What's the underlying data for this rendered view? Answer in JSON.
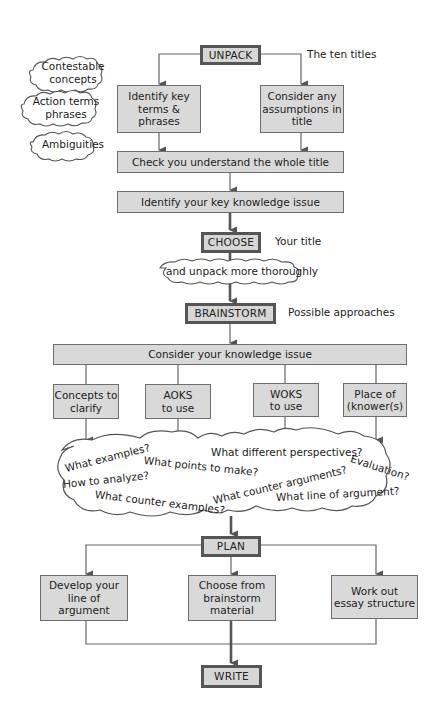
{
  "diagram": {
    "type": "flowchart",
    "colors": {
      "box_fill": "#d9d9d9",
      "border": "#6e6e6e",
      "key_border": "#555555",
      "line": "#555555"
    },
    "side_clouds": [
      {
        "id": "contestable",
        "text": "Contestable concepts",
        "line1": "Contestable",
        "line2": "concepts"
      },
      {
        "id": "action",
        "text": "Action terms phrases",
        "line1": "Action terms",
        "line2": "phrases"
      },
      {
        "id": "ambiguities",
        "text": "Ambiguities"
      }
    ],
    "unpack": {
      "label": "UNPACK",
      "note": "The ten titles"
    },
    "unpack_children": [
      {
        "label": "Identify key terms & phrases",
        "l1": "Identify key",
        "l2": "terms &",
        "l3": "phrases"
      },
      {
        "label": "Consider any assumptions in title",
        "l1": "Consider any",
        "l2": "assumptions in",
        "l3": "title"
      }
    ],
    "check": {
      "label": "Check you understand the whole title"
    },
    "identify_issue": {
      "label": "Identify your key knowledge issue"
    },
    "choose": {
      "label": "CHOOSE",
      "note": "Your title"
    },
    "unpack_cloud": {
      "text": "and unpack more thoroughly"
    },
    "brainstorm": {
      "label": "BRAINSTORM",
      "note": "Possible approaches"
    },
    "consider_issue": {
      "label": "Consider your knowledge issue"
    },
    "brainstorm_children": [
      {
        "l1": "Concepts to",
        "l2": "clarify"
      },
      {
        "l1": "AOKS",
        "l2": "to use"
      },
      {
        "l1": "WOKS",
        "l2": "to use"
      },
      {
        "l1": "Place of",
        "l2": "(knower(s)"
      }
    ],
    "question_cloud": [
      "What examples?",
      "What points to make?",
      "What different perspectives?",
      "Evaluation?",
      "How to analyze?",
      "What counter arguments?",
      "What counter examples?",
      "What line of argument?"
    ],
    "plan": {
      "label": "PLAN"
    },
    "plan_children": [
      {
        "l1": "Develop your",
        "l2": "line of argument"
      },
      {
        "l1": "Choose from",
        "l2": "brainstorm",
        "l3": "material"
      },
      {
        "l1": "Work out",
        "l2": "essay structure"
      }
    ],
    "write": {
      "label": "WRITE"
    }
  }
}
